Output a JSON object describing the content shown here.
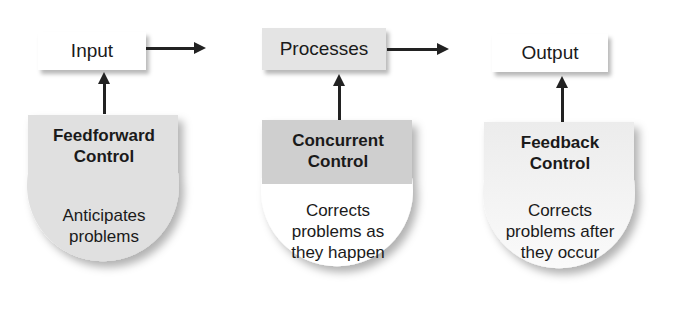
{
  "diagram": {
    "flow": [
      {
        "id": "input",
        "label": "Input"
      },
      {
        "id": "processes",
        "label": "Processes"
      },
      {
        "id": "output",
        "label": "Output"
      }
    ],
    "controls": [
      {
        "id": "feedforward",
        "title_line1": "Feedforward",
        "title_line2": "Control",
        "desc_line1": "Anticipates",
        "desc_line2": "problems",
        "desc_line3": "",
        "targets": "input"
      },
      {
        "id": "concurrent",
        "title_line1": "Concurrent",
        "title_line2": "Control",
        "desc_line1": "Corrects",
        "desc_line2": "problems as",
        "desc_line3": "they happen",
        "targets": "processes"
      },
      {
        "id": "feedback",
        "title_line1": "Feedback",
        "title_line2": "Control",
        "desc_line1": "Corrects",
        "desc_line2": "problems after",
        "desc_line3": "they occur",
        "targets": "output"
      }
    ]
  },
  "colors": {
    "white_box": "#ffffff",
    "gray_box": "#e4e4e4",
    "concurrent_header": "#cfcfcf",
    "arrow": "#222222",
    "text": "#1a1a1a"
  }
}
